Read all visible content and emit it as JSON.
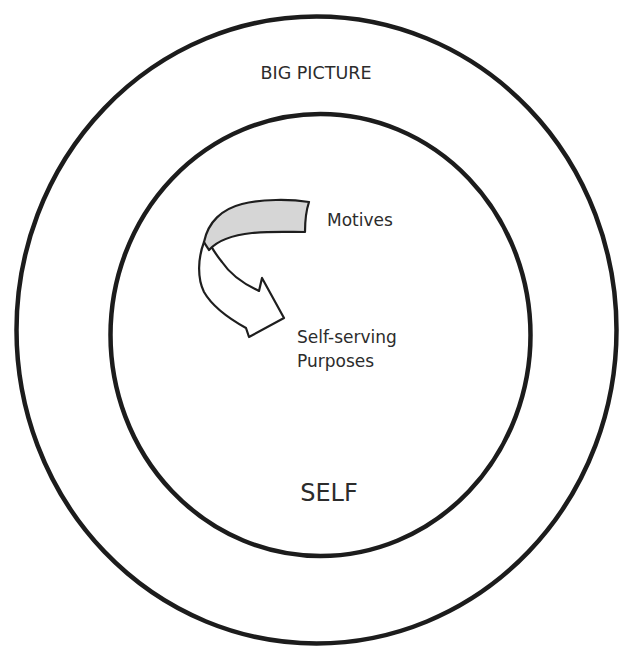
{
  "diagram": {
    "outer_circle": {
      "label": "BIG PICTURE",
      "stroke_color": "#1c1c1c"
    },
    "inner_circle": {
      "label": "SELF",
      "stroke_color": "#1c1c1c"
    },
    "arrow": {
      "from_label": "Motives",
      "to_label_line1": "Self-serving",
      "to_label_line2": "Purposes",
      "band_fill": "#d6d6d6",
      "body_fill": "#ffffff",
      "icon": "curved-arrow-icon"
    },
    "background_color": "#ffffff"
  }
}
